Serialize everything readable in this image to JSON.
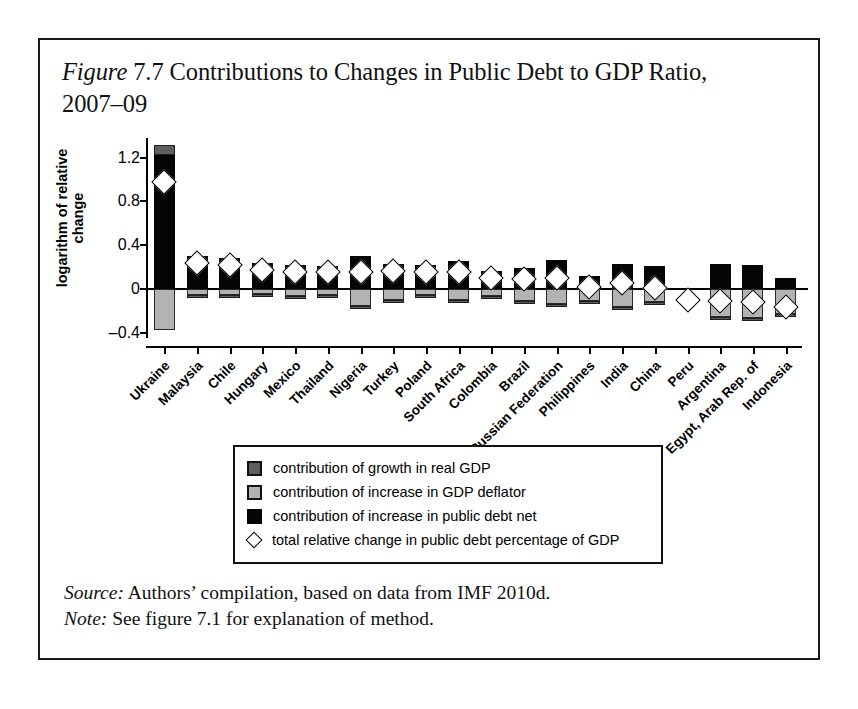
{
  "figure": {
    "label": "Figure",
    "number": "7.7",
    "title_rest": "Contributions to Changes in Public Debt to GDP Ratio, 2007–09",
    "source_lead": "Source:",
    "source_text": " Authors’ compilation, based on data from IMF 2010d.",
    "note_lead": "Note:",
    "note_text": " See figure 7.1 for explanation of method."
  },
  "legend": {
    "items": [
      {
        "swatch": "dark-gray-square",
        "label": "contribution of growth in real GDP",
        "color": "#5e5e5e"
      },
      {
        "swatch": "light-gray-square",
        "label": "contribution of increase in GDP deflator",
        "color": "#b3b3b3"
      },
      {
        "swatch": "black-square",
        "label": "contribution of increase in public debt net",
        "color": "#050505"
      },
      {
        "swatch": "white-diamond",
        "label": "total relative change in public debt percentage of GDP",
        "color": "#ffffff"
      }
    ]
  },
  "chart_data": {
    "type": "bar",
    "subtype": "stacked-bar-with-marker",
    "xlabel": "",
    "ylabel": "logarithm of relative change",
    "ylim": [
      -0.45,
      1.38
    ],
    "yticks": [
      1.2,
      0.8,
      0.4,
      0,
      -0.4
    ],
    "ytick_labels": [
      "1.2",
      "0.8",
      "0.4",
      "0",
      "–0.4"
    ],
    "grid": false,
    "legend_position": "below-plot",
    "zero_line": 0,
    "categories": [
      "Ukraine",
      "Malaysia",
      "Chile",
      "Hungary",
      "Mexico",
      "Thailand",
      "Nigeria",
      "Turkey",
      "Poland",
      "South Africa",
      "Colombia",
      "Brazil",
      "Russian Federation",
      "Philippines",
      "India",
      "China",
      "Peru",
      "Argentina",
      "Egypt, Arab Rep. of",
      "Indonesia"
    ],
    "series": [
      {
        "name": "contribution of increase in public debt net",
        "color": "#050505",
        "values": [
          1.22,
          0.3,
          0.28,
          0.24,
          0.22,
          0.21,
          0.3,
          0.23,
          0.22,
          0.25,
          0.16,
          0.19,
          0.26,
          0.12,
          0.23,
          0.21,
          0.0,
          0.23,
          0.22,
          0.1
        ]
      },
      {
        "name": "contribution of growth in real GDP",
        "color": "#5e5e5e",
        "values": [
          0.1,
          -0.02,
          -0.02,
          -0.05,
          -0.05,
          -0.03,
          -0.02,
          -0.01,
          -0.02,
          -0.03,
          -0.02,
          -0.02,
          -0.05,
          -0.03,
          -0.02,
          -0.03,
          0.0,
          -0.04,
          -0.04,
          -0.03
        ]
      },
      {
        "name": "contribution of increase in GDP deflator",
        "color": "#b3b3b3",
        "values": [
          -0.38,
          -0.06,
          -0.06,
          -0.05,
          -0.07,
          -0.06,
          -0.16,
          -0.1,
          -0.06,
          -0.1,
          -0.07,
          -0.11,
          -0.14,
          -0.11,
          -0.17,
          -0.12,
          0.0,
          -0.26,
          -0.27,
          -0.23
        ]
      },
      {
        "name": "total relative change in public debt percentage of GDP",
        "color": "#ffffff",
        "marker": "diamond",
        "values": [
          0.98,
          0.24,
          0.22,
          0.17,
          0.15,
          0.15,
          0.15,
          0.16,
          0.15,
          0.15,
          0.1,
          0.09,
          0.1,
          0.02,
          0.05,
          0.01,
          -0.1,
          -0.11,
          -0.12,
          -0.17
        ]
      }
    ]
  }
}
